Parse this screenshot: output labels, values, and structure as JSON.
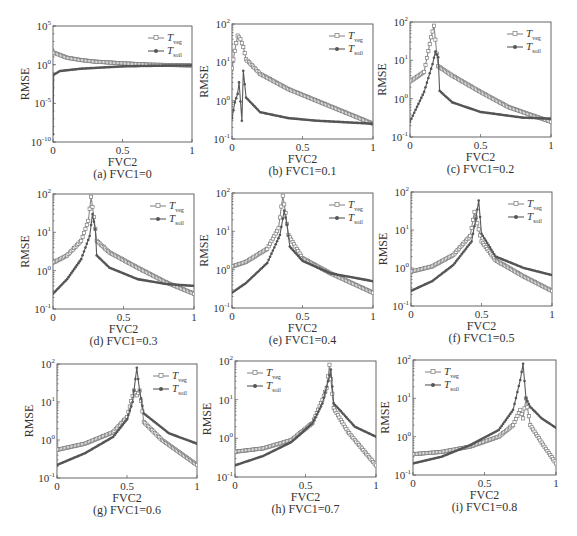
{
  "figure": {
    "ylabel": "RMSE",
    "xlabel": "FVC2",
    "xticks": [
      "0",
      "0.5",
      "1"
    ],
    "legend": {
      "veg": {
        "main": "T",
        "sub": "veg"
      },
      "soil": {
        "main": "T",
        "sub": "soil"
      }
    },
    "colors": {
      "veg": "#8a8a8a",
      "soil": "#5a5a5a",
      "frame": "#555555"
    }
  },
  "chart_data": [
    {
      "id": "a",
      "type": "line",
      "title": "(a) FVC1=0",
      "xlabel": "FVC2",
      "ylabel": "RMSE",
      "yscale": "log",
      "ylim_exp": [
        -10,
        5
      ],
      "yticks": [
        "10^5",
        "10^0",
        "10^-5",
        "10^-10"
      ],
      "legend_pos": "top-right",
      "frame": {
        "x0": 53,
        "y0": 26,
        "x1": 192,
        "y1": 142
      },
      "series": [
        {
          "name": "T_veg",
          "x": [
            0,
            0.1,
            0.2,
            0.3,
            0.5,
            0.7,
            1.0
          ],
          "y": [
            40,
            8,
            4,
            2.5,
            1.5,
            1.0,
            0.8
          ]
        },
        {
          "name": "T_soil",
          "x": [
            0,
            0.005,
            0.05,
            0.2,
            0.5,
            0.8,
            1.0
          ],
          "y": [
            1e-09,
            0.05,
            0.15,
            0.3,
            0.6,
            0.75,
            0.8
          ]
        }
      ]
    },
    {
      "id": "b",
      "type": "line",
      "title": "(b) FVC1=0.1",
      "xlabel": "FVC2",
      "ylabel": "RMSE",
      "yscale": "log",
      "ylim_exp": [
        -1,
        2
      ],
      "yticks": [
        "10^2",
        "10^1",
        "10^0",
        "10^-1"
      ],
      "legend_pos": "top-right",
      "frame": {
        "x0": 232,
        "y0": 24,
        "x1": 373,
        "y1": 139
      },
      "series": [
        {
          "name": "T_veg",
          "x": [
            0,
            0.02,
            0.04,
            0.06,
            0.08,
            0.1,
            0.2,
            0.4,
            0.6,
            0.8,
            1.0
          ],
          "y": [
            7,
            20,
            50,
            40,
            25,
            12,
            5,
            2,
            1,
            0.5,
            0.25
          ]
        },
        {
          "name": "T_soil",
          "x": [
            0,
            0.02,
            0.04,
            0.05,
            0.07,
            0.08,
            0.1,
            0.2,
            0.4,
            0.6,
            1.0
          ],
          "y": [
            0.35,
            0.9,
            1.5,
            3,
            0.3,
            6,
            1.2,
            0.5,
            0.35,
            0.3,
            0.25
          ]
        }
      ]
    },
    {
      "id": "c",
      "type": "line",
      "title": "(c) FVC1=0.2",
      "xlabel": "FVC2",
      "ylabel": "RMSE",
      "yscale": "log",
      "ylim_exp": [
        -1,
        2
      ],
      "yticks": [
        "10^2",
        "10^1",
        "10^0",
        "10^-1"
      ],
      "legend_pos": "top-right",
      "frame": {
        "x0": 410,
        "y0": 22,
        "x1": 551,
        "y1": 137
      },
      "series": [
        {
          "name": "T_veg",
          "x": [
            0,
            0.1,
            0.15,
            0.17,
            0.19,
            0.2,
            0.3,
            0.5,
            0.7,
            1.0
          ],
          "y": [
            2.8,
            5,
            40,
            80,
            15,
            7,
            4,
            1.5,
            0.6,
            0.25
          ]
        },
        {
          "name": "T_soil",
          "x": [
            0,
            0.1,
            0.16,
            0.18,
            0.2,
            0.21,
            0.3,
            0.5,
            0.8,
            1.0
          ],
          "y": [
            0.25,
            1.5,
            8,
            17,
            12,
            1.6,
            0.8,
            0.45,
            0.32,
            0.3
          ]
        }
      ]
    },
    {
      "id": "d",
      "type": "line",
      "title": "(d) FVC1=0.3",
      "xlabel": "FVC2",
      "ylabel": "RMSE",
      "yscale": "log",
      "ylim_exp": [
        -1,
        2
      ],
      "yticks": [
        "10^2",
        "10^1",
        "10^0",
        "10^-1"
      ],
      "legend_pos": "top-right",
      "frame": {
        "x0": 53,
        "y0": 194,
        "x1": 194,
        "y1": 309
      },
      "series": [
        {
          "name": "T_veg",
          "x": [
            0,
            0.1,
            0.2,
            0.25,
            0.27,
            0.29,
            0.31,
            0.4,
            0.6,
            0.8,
            1.0
          ],
          "y": [
            1.6,
            2.5,
            6,
            20,
            85,
            25,
            6,
            3,
            1.2,
            0.5,
            0.25
          ]
        },
        {
          "name": "T_soil",
          "x": [
            0,
            0.1,
            0.2,
            0.26,
            0.28,
            0.3,
            0.31,
            0.4,
            0.6,
            0.8,
            1.0
          ],
          "y": [
            0.25,
            0.6,
            2,
            8,
            30,
            12,
            2.5,
            1.2,
            0.6,
            0.45,
            0.4
          ]
        }
      ]
    },
    {
      "id": "e",
      "type": "line",
      "title": "(e) FVC1=0.4",
      "xlabel": "FVC2",
      "ylabel": "RMSE",
      "yscale": "log",
      "ylim_exp": [
        -1,
        2
      ],
      "yticks": [
        "10^2",
        "10^1",
        "10^0",
        "10^-1"
      ],
      "legend_pos": "top-right",
      "frame": {
        "x0": 232,
        "y0": 193,
        "x1": 373,
        "y1": 308
      },
      "series": [
        {
          "name": "T_veg",
          "x": [
            0,
            0.1,
            0.25,
            0.33,
            0.36,
            0.38,
            0.4,
            0.5,
            0.7,
            1.0
          ],
          "y": [
            1.2,
            1.6,
            3.5,
            12,
            85,
            30,
            8,
            2,
            0.8,
            0.25
          ]
        },
        {
          "name": "T_soil",
          "x": [
            0,
            0.1,
            0.25,
            0.34,
            0.37,
            0.39,
            0.41,
            0.5,
            0.7,
            1.0
          ],
          "y": [
            0.25,
            0.45,
            1.5,
            8,
            35,
            15,
            4,
            1.7,
            0.8,
            0.5
          ]
        }
      ]
    },
    {
      "id": "f",
      "type": "line",
      "title": "(f) FVC1=0.5",
      "xlabel": "FVC2",
      "ylabel": "RMSE",
      "yscale": "log",
      "ylim_exp": [
        -1,
        2
      ],
      "yticks": [
        "10^2",
        "10^1",
        "10^0",
        "10^-1"
      ],
      "legend_pos": "top-right",
      "frame": {
        "x0": 411,
        "y0": 192,
        "x1": 552,
        "y1": 306
      },
      "series": [
        {
          "name": "T_veg",
          "x": [
            0,
            0.15,
            0.3,
            0.42,
            0.45,
            0.47,
            0.5,
            0.6,
            0.8,
            1.0
          ],
          "y": [
            0.8,
            1.1,
            2.2,
            7,
            30,
            15,
            5,
            1.6,
            0.6,
            0.25
          ]
        },
        {
          "name": "T_soil",
          "x": [
            0,
            0.15,
            0.3,
            0.43,
            0.46,
            0.48,
            0.5,
            0.6,
            0.8,
            1.0
          ],
          "y": [
            0.25,
            0.45,
            1.2,
            5,
            20,
            60,
            8,
            2,
            1,
            0.65
          ]
        }
      ]
    },
    {
      "id": "g",
      "type": "line",
      "title": "(g) FVC1=0.6",
      "xlabel": "FVC2",
      "ylabel": "RMSE",
      "yscale": "log",
      "ylim_exp": [
        -1,
        2
      ],
      "yticks": [
        "10^2",
        "10^1",
        "10^0",
        "10^-1"
      ],
      "legend_pos": "top-right",
      "frame": {
        "x0": 57,
        "y0": 364,
        "x1": 197,
        "y1": 478
      },
      "series": [
        {
          "name": "T_veg",
          "x": [
            0,
            0.2,
            0.4,
            0.5,
            0.55,
            0.57,
            0.59,
            0.62,
            0.75,
            1.0
          ],
          "y": [
            0.55,
            0.8,
            1.6,
            4,
            20,
            15,
            20,
            3,
            1.0,
            0.22
          ]
        },
        {
          "name": "T_soil",
          "x": [
            0,
            0.2,
            0.4,
            0.5,
            0.54,
            0.57,
            0.59,
            0.62,
            0.8,
            1.0
          ],
          "y": [
            0.22,
            0.45,
            1.2,
            3.5,
            10,
            80,
            20,
            5,
            1.5,
            0.8
          ]
        }
      ]
    },
    {
      "id": "h",
      "type": "line",
      "title": "(h) FVC1=0.7",
      "xlabel": "FVC2",
      "ylabel": "RMSE",
      "yscale": "log",
      "ylim_exp": [
        -1,
        2
      ],
      "yticks": [
        "10^2",
        "10^1",
        "10^0",
        "10^-1"
      ],
      "legend_pos": "top-left",
      "frame": {
        "x0": 235,
        "y0": 361,
        "x1": 376,
        "y1": 477
      },
      "series": [
        {
          "name": "T_veg",
          "x": [
            0,
            0.2,
            0.4,
            0.55,
            0.62,
            0.65,
            0.67,
            0.7,
            0.8,
            1.0
          ],
          "y": [
            0.45,
            0.55,
            0.9,
            2.5,
            10,
            20,
            80,
            6,
            1.5,
            0.2
          ]
        },
        {
          "name": "T_soil",
          "x": [
            0,
            0.2,
            0.4,
            0.55,
            0.62,
            0.66,
            0.68,
            0.7,
            0.85,
            1.0
          ],
          "y": [
            0.2,
            0.35,
            0.8,
            2.5,
            8,
            30,
            60,
            8,
            2,
            1.1
          ]
        }
      ]
    },
    {
      "id": "i",
      "type": "line",
      "title": "(i) FVC1=0.8",
      "xlabel": "FVC2",
      "ylabel": "RMSE",
      "yscale": "log",
      "ylim_exp": [
        -1,
        2
      ],
      "yticks": [
        "10^2",
        "10^1",
        "10^0",
        "10^-1"
      ],
      "legend_pos": "top-left",
      "frame": {
        "x0": 413,
        "y0": 360,
        "x1": 556,
        "y1": 475
      },
      "series": [
        {
          "name": "T_veg",
          "x": [
            0,
            0.2,
            0.4,
            0.6,
            0.7,
            0.75,
            0.77,
            0.79,
            0.82,
            0.9,
            1.0
          ],
          "y": [
            0.35,
            0.4,
            0.55,
            1.0,
            2,
            5,
            3,
            10,
            2,
            0.7,
            0.2
          ]
        },
        {
          "name": "T_soil",
          "x": [
            0,
            0.2,
            0.4,
            0.6,
            0.7,
            0.75,
            0.77,
            0.79,
            0.82,
            0.9,
            1.0
          ],
          "y": [
            0.2,
            0.3,
            0.6,
            1.5,
            5,
            30,
            80,
            10,
            6,
            3,
            1.7
          ]
        }
      ]
    }
  ]
}
